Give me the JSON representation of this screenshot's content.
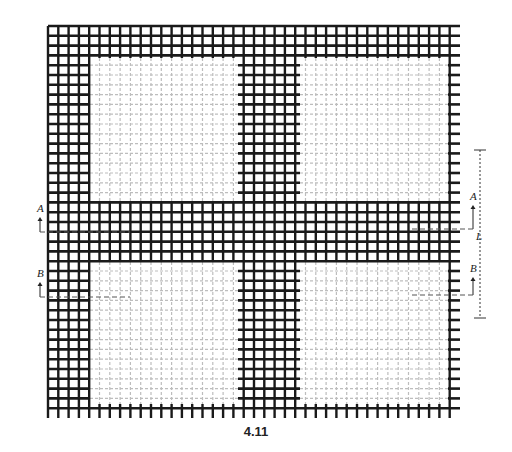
{
  "figure": {
    "caption": "4.11",
    "type": "weave draft diagram",
    "colors": {
      "thread_dark": "#1a1a1a",
      "thread_light": "#bdbdbd",
      "background": "#ffffff"
    },
    "grid": {
      "x0": 48,
      "x1": 460,
      "y0": 26,
      "y1": 418
    },
    "puff_regions": [
      {
        "name": "top-left",
        "x0": 90,
        "x1": 236,
        "y0": 58,
        "y1": 200
      },
      {
        "name": "top-right",
        "x0": 300,
        "x1": 446,
        "y0": 58,
        "y1": 200
      },
      {
        "name": "bottom-left",
        "x0": 90,
        "x1": 236,
        "y0": 262,
        "y1": 402
      },
      {
        "name": "bottom-right",
        "x0": 300,
        "x1": 446,
        "y0": 262,
        "y1": 402
      }
    ],
    "section_markers": [
      {
        "label": "A",
        "side": "left",
        "x": 37,
        "y": 212,
        "line_y": 232
      },
      {
        "label": "B",
        "side": "left",
        "x": 37,
        "y": 277,
        "line_y": 297
      },
      {
        "label": "A",
        "side": "right",
        "x": 470,
        "y": 200,
        "line_y": 229
      },
      {
        "label": "B",
        "side": "right",
        "x": 470,
        "y": 272,
        "line_y": 295
      }
    ],
    "dimension": {
      "label": "L",
      "x": 480,
      "y_top": 150,
      "y_bottom": 318
    }
  }
}
